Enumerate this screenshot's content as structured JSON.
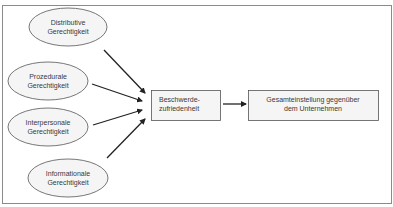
{
  "diagram": {
    "colors": {
      "stroke": "#555555",
      "box_fill": "#f4f4f4",
      "ellipse_fill": "#f4f4f4",
      "text": "#3a3a3a",
      "frame": "#8a8a8a"
    },
    "inputs": [
      {
        "line1": "Distributive",
        "line2": "Gerechtigkeit"
      },
      {
        "line1": "Prozedurale",
        "line2": "Gerechtigkeit"
      },
      {
        "line1": "Interpersonale",
        "line2": "Gerechtigkeit"
      },
      {
        "line1": "Informationale",
        "line2": "Gerechtigkeit"
      }
    ],
    "mediator": {
      "line1": "Beschwerde-",
      "line2": "zufriedenheit"
    },
    "outcome": {
      "line1": "Gesamteinstellung gegenüber",
      "line2": "dem Unternehmen"
    }
  }
}
